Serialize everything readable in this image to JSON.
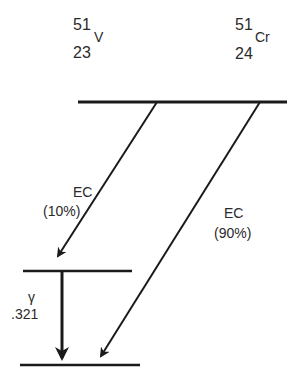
{
  "diagram": {
    "colors": {
      "line": "#1a1a1a",
      "text": "#2a2a2a",
      "background": "#ffffff"
    },
    "nuclides": [
      {
        "id": "v51",
        "mass_number": "51",
        "atomic_number": "23",
        "symbol": "V"
      },
      {
        "id": "cr51",
        "mass_number": "51",
        "atomic_number": "24",
        "symbol": "Cr"
      }
    ],
    "levels": [
      {
        "id": "cr51-ground",
        "x1": 78,
        "x2": 287,
        "y": 102
      },
      {
        "id": "v51-excited",
        "x1": 23,
        "x2": 132,
        "y": 271
      },
      {
        "id": "v51-ground",
        "x1": 20,
        "x2": 140,
        "y": 365
      }
    ],
    "transitions": [
      {
        "id": "ec-10",
        "type": "EC",
        "label": "EC",
        "branch": "(10%)",
        "from": [
          157,
          102
        ],
        "to": [
          58,
          256
        ]
      },
      {
        "id": "ec-90",
        "type": "EC",
        "label": "EC",
        "branch": "(90%)",
        "from": [
          260,
          102
        ],
        "to": [
          101,
          356
        ]
      },
      {
        "id": "gamma",
        "type": "gamma",
        "label": "γ",
        "energy": ".321",
        "from": [
          62,
          272
        ],
        "to": [
          62,
          358
        ]
      }
    ]
  }
}
